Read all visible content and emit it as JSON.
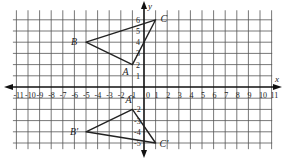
{
  "diagram": {
    "type": "coordinate-plane",
    "axes": {
      "x_label": "x",
      "y_label": "y",
      "x_range": [
        -11,
        11
      ],
      "y_range": [
        -5,
        6
      ],
      "x_ticks": [
        "-11",
        "-10",
        "-9",
        "-8",
        "-7",
        "-6",
        "-5",
        "-4",
        "-3",
        "-2",
        "-1",
        "0",
        "1",
        "2",
        "3",
        "4",
        "5",
        "6",
        "7",
        "8",
        "9",
        "10",
        "11"
      ],
      "y_ticks_positive": [
        "1",
        "2",
        "3",
        "4",
        "5",
        "6"
      ],
      "y_ticks_negative": [
        "-2",
        "-3",
        "-4",
        "-5"
      ]
    },
    "triangles": [
      {
        "name": "ABC",
        "vertices": [
          {
            "label": "A",
            "x": -1,
            "y": 2
          },
          {
            "label": "B",
            "x": -5,
            "y": 4
          },
          {
            "label": "C",
            "x": 1,
            "y": 6
          }
        ]
      },
      {
        "name": "A'B'C'",
        "vertices": [
          {
            "label": "A'",
            "x": -1,
            "y": -2
          },
          {
            "label": "B'",
            "x": -5,
            "y": -4
          },
          {
            "label": "C'",
            "x": 1,
            "y": -5
          }
        ]
      }
    ],
    "colors": {
      "grid": "#555555",
      "axis": "#111111",
      "triangle": "#222222",
      "background": "#ffffff"
    }
  }
}
